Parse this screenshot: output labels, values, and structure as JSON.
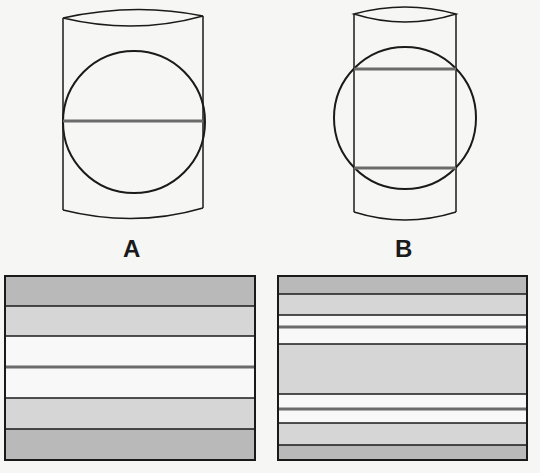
{
  "figure": {
    "panels": [
      {
        "label": "A",
        "description": "Cylinder with inscribed circle; one horizontal section line through center",
        "section_lines": 1
      },
      {
        "label": "B",
        "description": "Narrower cylinder with larger circle extending beyond sides; two horizontal section lines",
        "section_lines": 2
      }
    ],
    "colors": {
      "background": "#f6f6f5",
      "outline": "#1a1a1a",
      "section_line": "#6b6b6b",
      "band_dark": "#b9b9b9",
      "band_light": "#d6d6d6",
      "band_white": "#f8f8f8"
    },
    "strips": [
      {
        "panel": "A",
        "bands": [
          "dark",
          "light",
          "white",
          "white",
          "light",
          "dark"
        ]
      },
      {
        "panel": "B",
        "bands": [
          "dark",
          "light",
          "white",
          "white",
          "light",
          "white",
          "white",
          "light",
          "dark"
        ]
      }
    ]
  }
}
